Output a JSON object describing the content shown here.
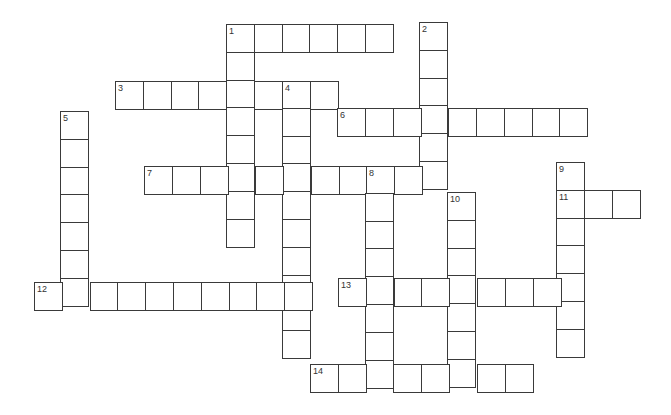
{
  "puzzle": {
    "type": "crossword",
    "cell_size": 27.8,
    "words": [
      {
        "number": "1",
        "direction": "across",
        "x": 226,
        "y": 24,
        "length": 6
      },
      {
        "number": "1",
        "direction": "down",
        "x": 226,
        "y": 24,
        "length": 8
      },
      {
        "number": "2",
        "direction": "down",
        "x": 419,
        "y": 22,
        "length": 6
      },
      {
        "number": "3",
        "direction": "across",
        "x": 115,
        "y": 81,
        "length": 8
      },
      {
        "number": "4",
        "direction": "down",
        "x": 282,
        "y": 80,
        "length": 10
      },
      {
        "number": "5",
        "direction": "down",
        "x": 60,
        "y": 111,
        "length": 7
      },
      {
        "number": "6",
        "direction": "across",
        "x": 337,
        "y": 108,
        "length": 9
      },
      {
        "number": "7",
        "direction": "across",
        "x": 144,
        "y": 166,
        "length": 11
      },
      {
        "number": "8",
        "direction": "down",
        "x": 365,
        "y": 165,
        "length": 8
      },
      {
        "number": "9",
        "direction": "down",
        "x": 556,
        "y": 162,
        "length": 7
      },
      {
        "number": "10",
        "direction": "down",
        "x": 447,
        "y": 192,
        "length": 7
      },
      {
        "number": "11",
        "direction": "across",
        "x": 556,
        "y": 190,
        "length": 3
      },
      {
        "number": "12",
        "direction": "across",
        "x": 34,
        "y": 282,
        "length": 10
      },
      {
        "number": "13",
        "direction": "across",
        "x": 338,
        "y": 278,
        "length": 9
      },
      {
        "number": "14",
        "direction": "across",
        "x": 310,
        "y": 364,
        "length": 8
      }
    ]
  }
}
